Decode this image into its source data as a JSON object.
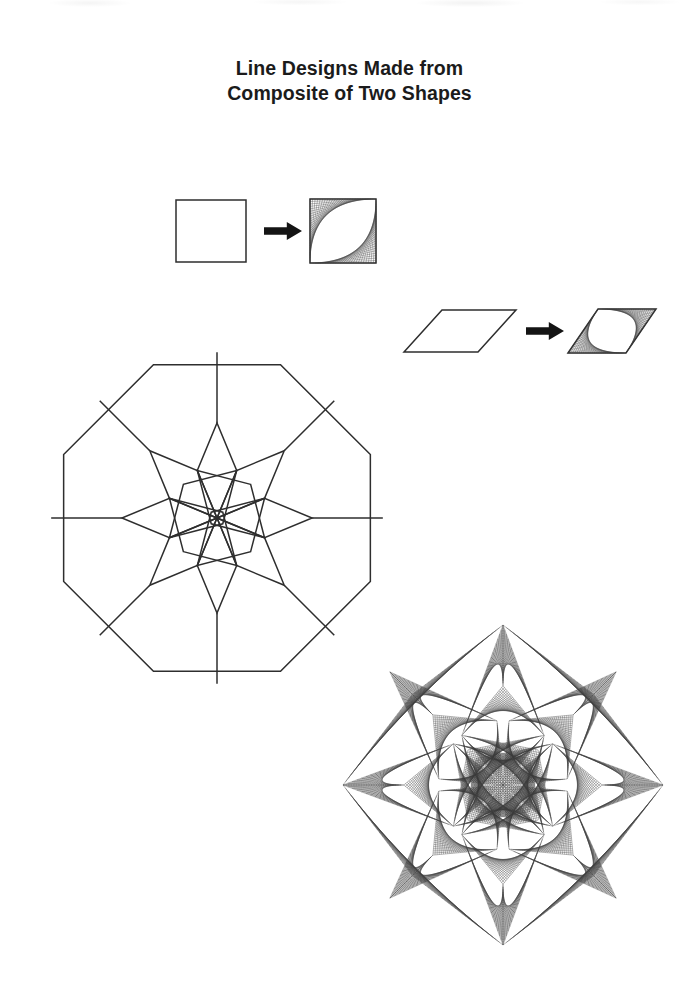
{
  "document": {
    "title_line_1": "Line Designs Made from",
    "title_line_2": "Composite of Two Shapes",
    "background_color": "#ffffff",
    "ink_color": "#2e2e2e",
    "page_width": 699,
    "page_height": 990
  },
  "figures": {
    "square_transform": {
      "name": "square-to-curve-stitch",
      "source_shape": "square",
      "result_shape": "curve-stitched square",
      "arrow_glyph": "right-arrow",
      "source": {
        "x": 176,
        "y": 200,
        "width": 70,
        "height": 62
      },
      "arrow": {
        "x": 264,
        "y": 222,
        "width": 38,
        "height": 18
      },
      "result": {
        "x": 310,
        "y": 199,
        "width": 66,
        "height": 64
      },
      "stitch_lines": 26,
      "stitched_corners": [
        "top-left",
        "bottom-right"
      ],
      "lens_axis": "anti-diagonal"
    },
    "rhombus_transform": {
      "name": "rhombus-to-curve-stitch",
      "source_shape": "rhombus",
      "result_shape": "curve-stitched rhombus",
      "arrow_glyph": "right-arrow",
      "source": {
        "x": 404,
        "y": 310,
        "width": 112,
        "height": 42,
        "skew": 38
      },
      "arrow": {
        "x": 526,
        "y": 322,
        "width": 38,
        "height": 18
      },
      "result": {
        "x": 568,
        "y": 309,
        "width": 88,
        "height": 44,
        "skew": 30
      },
      "stitch_lines": 26,
      "stitched_corners": [
        "left-acute",
        "right-acute"
      ],
      "lens_axis": "long-diagonal"
    },
    "octagon_outline": {
      "name": "octagonal-rosette-outline",
      "center_x": 217,
      "center_y": 518,
      "rhombus_count": 8,
      "square_count": 4,
      "outer_shape": "octagon",
      "edge_length": 103,
      "circumradius": 166,
      "rotation_deg": 22.5,
      "bounds": {
        "x": 52,
        "y": 353,
        "width": 330,
        "height": 330
      }
    },
    "octagon_stitched": {
      "name": "octagonal-rosette-curve-stitched",
      "center_x": 503,
      "center_y": 785,
      "petal_count": 8,
      "corner_lens_count": 4,
      "stitch_lines": 30,
      "bounds": {
        "x": 348,
        "y": 626,
        "width": 315,
        "height": 319
      },
      "circumradius": 160,
      "rotation_deg": 22.5
    }
  },
  "colors": {
    "ink": "#2e2e2e",
    "stitch": "#3a3a3a",
    "arrow": "#141414",
    "title": "#1b1b1b",
    "paper": "#ffffff"
  }
}
